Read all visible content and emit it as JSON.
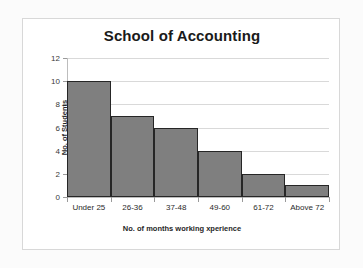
{
  "chart_data": {
    "type": "bar",
    "title": "School of Accounting",
    "xlabel": "No. of months working xperience",
    "ylabel": "No. of Students",
    "categories": [
      "Under 25",
      "26-36",
      "37-48",
      "49-60",
      "61-72",
      "Above 72"
    ],
    "values": [
      10,
      7,
      6,
      4,
      2,
      1
    ],
    "ylim": [
      0,
      12
    ],
    "ytick_labels": [
      "0",
      "2",
      "4",
      "6",
      "8",
      "10",
      "12"
    ],
    "ytick_values": [
      0,
      2,
      4,
      6,
      8,
      10,
      12
    ],
    "grid": true,
    "legend": false,
    "bar_color": "#7f7f7f",
    "bar_edge_color": "#262626",
    "gridline_color": "#d9d9d9",
    "plot_background": "#ffffff",
    "frame_border_color": "#d8d8d8",
    "page_background": "#fbfbfb"
  }
}
